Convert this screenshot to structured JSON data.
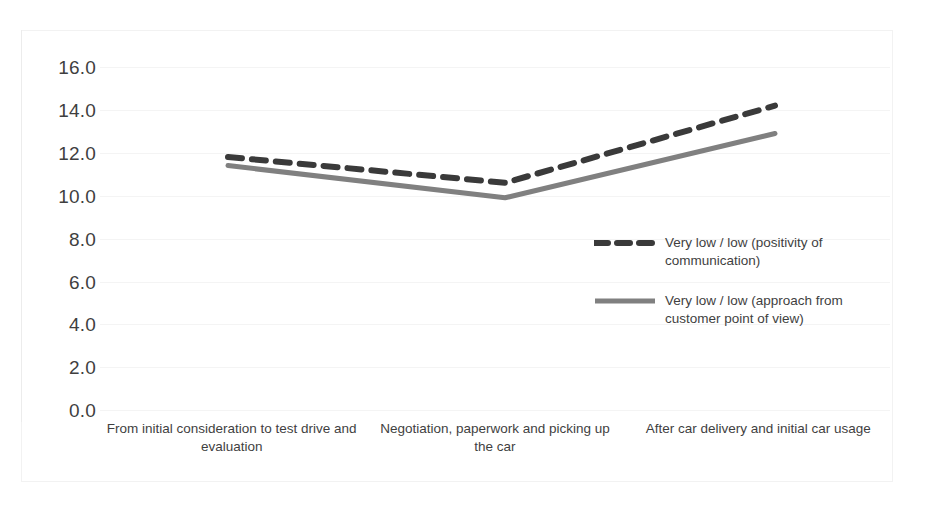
{
  "chart_data": {
    "type": "line",
    "title": "",
    "subtitle": "",
    "xlabel": "",
    "ylabel": "",
    "categories": [
      "From initial consideration to test drive and evaluation",
      "Negotiation, paperwork and picking up the car",
      "After car delivery and initial car usage"
    ],
    "series": [
      {
        "name": "Very low / low (positivity of communication)",
        "values": [
          11.8,
          10.6,
          14.2
        ],
        "style": "dashed",
        "color": "#3a3a3a"
      },
      {
        "name": "Very low / low (approach from customer point of view)",
        "values": [
          11.4,
          9.9,
          12.9
        ],
        "style": "solid",
        "color": "#808080"
      }
    ],
    "ylim": [
      0.0,
      16.0
    ],
    "ytick_step": 2.0,
    "ytick_labels": [
      "16.0",
      "14.0",
      "12.0",
      "10.0",
      "8.0",
      "6.0",
      "4.0",
      "2.0",
      "0.0"
    ],
    "grid": true,
    "legend_position": "inside-right-middle"
  },
  "legend": {
    "entries": [
      {
        "label": "Very low / low (positivity of communication)",
        "swatch": "dashed-line-swatch",
        "color": "#3a3a3a"
      },
      {
        "label": "Very low / low (approach from customer point of view)",
        "swatch": "solid-line-swatch",
        "color": "#808080"
      }
    ]
  },
  "colors": {
    "series_dashed": "#3a3a3a",
    "series_solid": "#808080",
    "gridline": "#f4f4f4",
    "axis": "#ececec",
    "text": "#3f3f3f",
    "background": "#ffffff"
  }
}
